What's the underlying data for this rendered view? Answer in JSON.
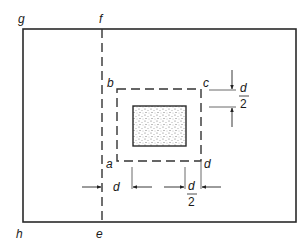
{
  "diagram": {
    "colors": {
      "line": "#2a2a2a",
      "dash": "#333333",
      "stipple": "#555555",
      "background": "#ffffff"
    },
    "labels": {
      "g": "g",
      "f": "f",
      "h": "h",
      "e": "e",
      "a": "a",
      "b": "b",
      "c": "c",
      "d_corner": "d"
    },
    "dimensions": {
      "right_top": {
        "numerator": "d",
        "denominator": "2"
      },
      "bottom_left": {
        "text": "d"
      },
      "bottom_right": {
        "numerator": "d",
        "denominator": "2"
      }
    },
    "elements": [
      "outer slab boundary g-f-...-e-h",
      "dashed line f-e",
      "dashed critical perimeter a-b-c-d",
      "stippled column"
    ]
  }
}
